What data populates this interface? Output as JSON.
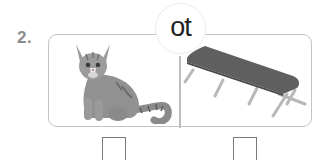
{
  "question": {
    "number": "2.",
    "word_ending": "ot",
    "pictures": [
      {
        "id": "cat",
        "label": "cat",
        "icon": "cat-icon"
      },
      {
        "id": "cot",
        "label": "cot",
        "icon": "cot-icon"
      }
    ],
    "answer_boxes": [
      {
        "for": "cat",
        "value": ""
      },
      {
        "for": "cot",
        "value": ""
      }
    ]
  },
  "colors": {
    "frame_border": "#c4c4c4",
    "number": "#8a8a8a",
    "cat_fur": "#8f8f8f",
    "cot_fabric": "#5e5e5e",
    "cot_legs": "#b8b8b8",
    "box_border": "#7a7a7a"
  }
}
